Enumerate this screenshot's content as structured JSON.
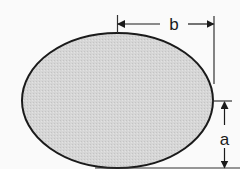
{
  "diagram": {
    "shape": "ellipse",
    "fill_color": "#d4d4d4",
    "stroke_color": "#1a1a1a",
    "background": "#fafafa",
    "dimensions": [
      {
        "id": "b",
        "label": "b",
        "orientation": "horizontal",
        "meaning": "semi-axis from center to right edge"
      },
      {
        "id": "a",
        "label": "a",
        "orientation": "vertical",
        "meaning": "semi-axis from center to bottom edge"
      }
    ]
  }
}
